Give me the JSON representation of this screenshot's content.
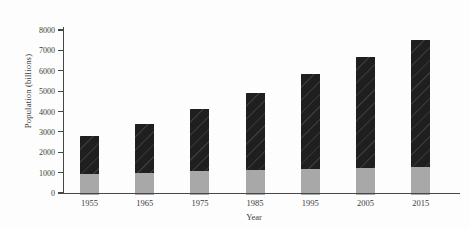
{
  "chart_data": {
    "type": "bar",
    "stacked": true,
    "title": "",
    "xlabel": "Year",
    "ylabel": "Population (billions)",
    "categories": [
      "1955",
      "1965",
      "1975",
      "1985",
      "1995",
      "2005",
      "2015"
    ],
    "series": [
      {
        "name": "bottom-gray-segment",
        "color": "#a8a8a8",
        "values": [
          950,
          1000,
          1100,
          1150,
          1200,
          1250,
          1300
        ]
      },
      {
        "name": "top-black-segment",
        "color": "#1f1f1f",
        "values": [
          1850,
          2400,
          3000,
          3750,
          4650,
          5450,
          6200
        ]
      }
    ],
    "stack_totals": [
      2800,
      3400,
      4100,
      4900,
      5850,
      6700,
      7500
    ],
    "ylim": [
      0,
      8000
    ],
    "yticks": [
      0,
      1000,
      2000,
      3000,
      4000,
      5000,
      6000,
      7000,
      8000
    ],
    "grid": false,
    "legend": "none",
    "colors": {
      "axis": "#474747",
      "text": "#3c3c3c",
      "background": "#fdfdfd"
    }
  }
}
